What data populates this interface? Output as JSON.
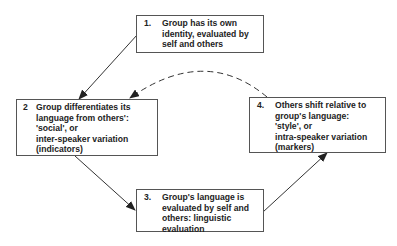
{
  "diagram": {
    "type": "cycle-flowchart",
    "nodes": [
      {
        "id": "1",
        "number": "1.",
        "text": "Group has its own\nidentity, evaluated by\nself and others"
      },
      {
        "id": "2",
        "number": "2",
        "text": "Group differentiates its\nlanguage from others':\n'social', or\ninter-speaker variation\n(indicators)"
      },
      {
        "id": "3",
        "number": "3.",
        "text": "Group's language is\nevaluated by self and\nothers: linguistic\nevaluation"
      },
      {
        "id": "4",
        "number": "4.",
        "text": "Others shift relative to\ngroup's language:\n'style', or\nintra-speaker variation\n(markers)"
      }
    ],
    "edges": [
      {
        "from": "1",
        "to": "2",
        "style": "solid"
      },
      {
        "from": "2",
        "to": "3",
        "style": "solid"
      },
      {
        "from": "3",
        "to": "4",
        "style": "solid"
      },
      {
        "from": "4",
        "to": "2",
        "style": "dashed"
      }
    ],
    "colors": {
      "line": "#333333",
      "box_border": "#555555",
      "text": "#222222",
      "background": "#ffffff"
    }
  }
}
